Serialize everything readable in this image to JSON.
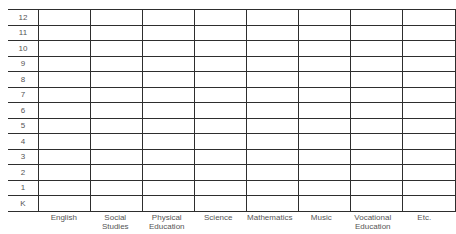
{
  "grid": {
    "grades": [
      "12",
      "11",
      "10",
      "9",
      "8",
      "7",
      "6",
      "5",
      "4",
      "3",
      "2",
      "1",
      "K"
    ],
    "subjects": [
      "English",
      "Social Studies",
      "Physical Education",
      "Science",
      "Mathematics",
      "Music",
      "Vocational Education",
      "Etc."
    ],
    "subject_lines": [
      [
        "English"
      ],
      [
        "Social",
        "Studies"
      ],
      [
        "Physical",
        "Education"
      ],
      [
        "Science"
      ],
      [
        "Mathematics"
      ],
      [
        "Music"
      ],
      [
        "Vocational",
        "Education"
      ],
      [
        "Etc."
      ]
    ],
    "line_color": "#2e2e2e",
    "text_color": "#555555"
  }
}
